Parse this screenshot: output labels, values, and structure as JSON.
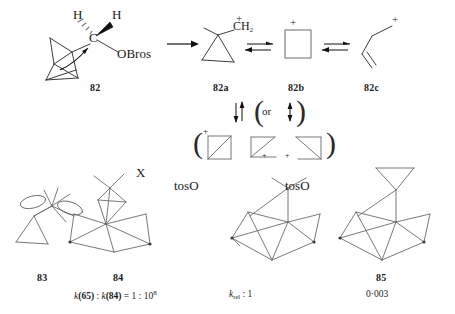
{
  "scheme": {
    "title": "Solvolysis of spiropentylcarbinyl brosylate and related cyclopropylcarbinyl cation equilibria",
    "row1": {
      "structure_82": {
        "name": "spiropentylcarbinyl-brosylate",
        "label": "82",
        "atoms": {
          "h_left": "H",
          "h_right": "H",
          "c_center": "C",
          "leaving_group": "OBros"
        }
      },
      "arrow_main": "→",
      "structure_82a": {
        "name": "cyclopropylcarbinyl-cation",
        "label": "82a",
        "atoms": {
          "carbinyl": "CH",
          "carbinyl_sub": "2",
          "charge": "+"
        }
      },
      "equilibrium_1": "⇌",
      "structure_82b": {
        "name": "cyclobutyl-cation",
        "label": "82b",
        "charge": "+"
      },
      "equilibrium_2": "⇌",
      "structure_82c": {
        "name": "allyl-carbinyl-cation",
        "label": "82c",
        "charge": "+"
      }
    },
    "row2": {
      "vertical_equilibrium": "⇅",
      "or_open_paren": "(",
      "or_text": "or",
      "or_arrow": "↕",
      "or_close_paren": ")",
      "bracket_open": "(",
      "bracket_close": ")",
      "resonance_charges": [
        "+",
        "+",
        "+"
      ],
      "resonance_names": [
        "bicyclobutonium-a",
        "bicyclobutonium-b",
        "bicyclobutonium-c"
      ]
    },
    "row3": {
      "structure_83": {
        "name": "spiropentyl-cation-orbital",
        "label": "83"
      },
      "structure_84": {
        "name": "bicyclic-cage-x",
        "label": "84",
        "substituent": "X",
        "caption_parts": {
          "k1": "k",
          "n1": "(65)",
          "colon": " : ",
          "k2": "k",
          "n2": "(84)",
          "eq": " = 1 : 10",
          "exp": "8"
        },
        "caption_text": "k(65) : k(84) = 1 : 10⁸"
      },
      "structure_ref": {
        "name": "adamantyl-tosylate-reference",
        "leaving_group": "tosO",
        "caption_k": "k",
        "caption_sub": "rel",
        "caption_rest": " : 1",
        "caption_text": "k_rel : 1"
      },
      "structure_85": {
        "name": "cyclopropyl-adamantyl-tosylate",
        "label": "85",
        "leaving_group": "tosO",
        "rate": "0·003"
      }
    }
  },
  "colors": {
    "ink": "#1a1a1a",
    "line": "#3c3c3c",
    "line_light": "#6a6a6a",
    "background": "#ffffff"
  }
}
